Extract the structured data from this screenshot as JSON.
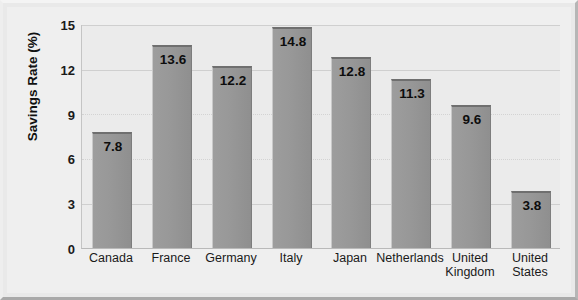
{
  "chart_data": {
    "type": "bar",
    "title": "",
    "xlabel": "",
    "ylabel": "Savings Rate (%)",
    "ylim": [
      0,
      15
    ],
    "yticks": [
      0,
      3,
      6,
      9,
      12,
      15
    ],
    "grid": true,
    "legend": null,
    "categories": [
      "Canada",
      "France",
      "Germany",
      "Italy",
      "Japan",
      "Netherlands",
      "United Kingdom",
      "United States"
    ],
    "category_lines": [
      [
        "Canada"
      ],
      [
        "France"
      ],
      [
        "Germany"
      ],
      [
        "Italy"
      ],
      [
        "Japan"
      ],
      [
        "Netherlands"
      ],
      [
        "United",
        "Kingdom"
      ],
      [
        "United",
        "States"
      ]
    ],
    "values": [
      7.8,
      13.6,
      12.2,
      14.8,
      12.8,
      11.3,
      9.6,
      3.8
    ],
    "value_labels": [
      "7.8",
      "13.6",
      "12.2",
      "14.8",
      "12.8",
      "11.3",
      "9.6",
      "3.8"
    ],
    "colors": {
      "bar_fill": "#989898",
      "bar_top_edge": "#6f6f6f",
      "plot_background": "#ebebeb",
      "frame_background": "#efefef",
      "gridline": "#cfcfcf",
      "text": "#111111"
    }
  }
}
